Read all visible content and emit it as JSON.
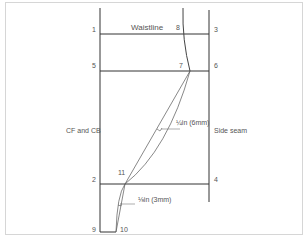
{
  "figure": {
    "title_label": "Waistline",
    "left_label": "CF and CB",
    "right_label": "Side seam",
    "points": {
      "p1": "1",
      "p2": "2",
      "p3": "3",
      "p4": "4",
      "p5": "5",
      "p6": "6",
      "p7": "7",
      "p8": "8",
      "p9": "9",
      "p10": "10",
      "p11": "11"
    },
    "measure_upper": "¼in (6mm)",
    "measure_lower": "⅛in (3mm)",
    "colors": {
      "line": "#333333",
      "curve": "#555555",
      "frame": "#d6d6d6",
      "text": "#555555"
    }
  }
}
